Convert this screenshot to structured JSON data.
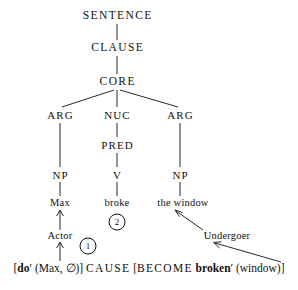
{
  "diagram": {
    "type": "rrg-layered-structure-tree",
    "tree_nodes": [
      {
        "id": "sentence",
        "label": "SENTENCE",
        "x": 117,
        "y": 16,
        "style": "cat"
      },
      {
        "id": "clause",
        "label": "CLAUSE",
        "x": 117,
        "y": 48,
        "style": "cat"
      },
      {
        "id": "core",
        "label": "CORE",
        "x": 117,
        "y": 82,
        "style": "cat"
      },
      {
        "id": "arg-left",
        "label": "ARG",
        "x": 60,
        "y": 115,
        "style": "cat-sm"
      },
      {
        "id": "nuc",
        "label": "NUC",
        "x": 117,
        "y": 115,
        "style": "cat-sm"
      },
      {
        "id": "arg-right",
        "label": "ARG",
        "x": 180,
        "y": 115,
        "style": "cat-sm"
      },
      {
        "id": "pred",
        "label": "PRED",
        "x": 117,
        "y": 145,
        "style": "cat-sm"
      },
      {
        "id": "np-left",
        "label": "NP",
        "x": 60,
        "y": 175,
        "style": "cat-sm"
      },
      {
        "id": "v",
        "label": "V",
        "x": 117,
        "y": 175,
        "style": "cat-sm"
      },
      {
        "id": "np-right",
        "label": "NP",
        "x": 180,
        "y": 175,
        "style": "cat-sm"
      }
    ],
    "words": [
      {
        "id": "max",
        "label": "Max",
        "x": 60,
        "y": 203
      },
      {
        "id": "broke",
        "label": "broke",
        "x": 117,
        "y": 203
      },
      {
        "id": "the-window",
        "label": "the window",
        "x": 183,
        "y": 203
      }
    ],
    "macroroles": [
      {
        "id": "actor",
        "label": "Actor",
        "x": 60,
        "y": 236
      },
      {
        "id": "undergoer",
        "label": "Undergoer",
        "x": 227,
        "y": 236
      }
    ],
    "markers": [
      {
        "id": "marker-1",
        "label": "1",
        "x": 88,
        "y": 246
      },
      {
        "id": "marker-2",
        "label": "2",
        "x": 117,
        "y": 222
      }
    ],
    "logical_structure": {
      "open_bracket": "[",
      "do": "do",
      "do_prime": "′",
      "do_args": " (Max, ∅)]",
      "cause": "CAUSE",
      "become_open": " [",
      "become": "BECOME",
      "broken": "broken",
      "broken_prime": "′",
      "broken_args": " (window)]"
    }
  }
}
